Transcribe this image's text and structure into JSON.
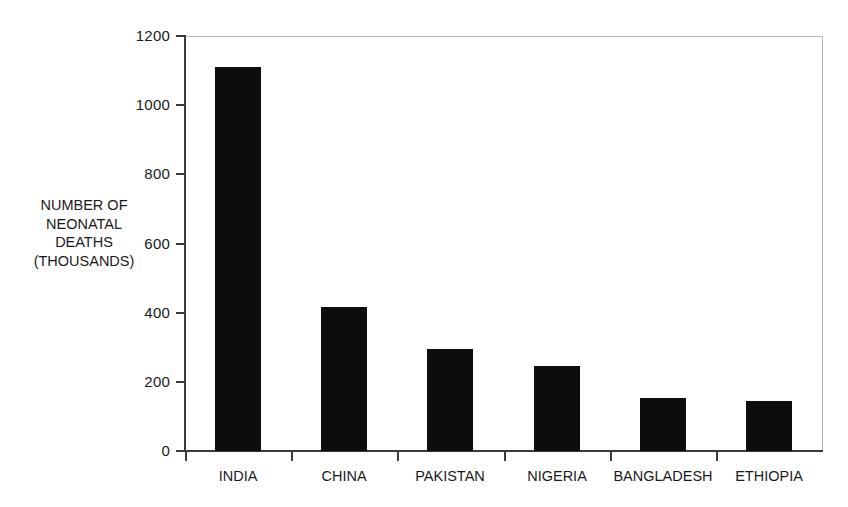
{
  "chart_data": {
    "type": "bar",
    "title": "",
    "xlabel": "",
    "ylabel": "NUMBER OF NEONATAL DEATHS (THOUSANDS)",
    "ylabel_lines": [
      "NUMBER OF",
      "NEONATAL",
      "DEATHS",
      "(THOUSANDS)"
    ],
    "categories": [
      "INDIA",
      "CHINA",
      "PAKISTAN",
      "NIGERIA",
      "BANGLADESH",
      "ETHIOPIA"
    ],
    "values": [
      1110,
      415,
      295,
      245,
      152,
      146
    ],
    "ylim": [
      0,
      1200
    ],
    "ytick_labels": [
      "0",
      "200",
      "400",
      "600",
      "800",
      "1000",
      "1200"
    ],
    "ytick_values": [
      0,
      200,
      400,
      600,
      800,
      1000,
      1200
    ],
    "grid": false,
    "legend": "none",
    "bar_color": "#0d0d0d",
    "axis_color": "#3a3a3a",
    "frame_color": "#b9b9b9",
    "background": "#ffffff"
  }
}
